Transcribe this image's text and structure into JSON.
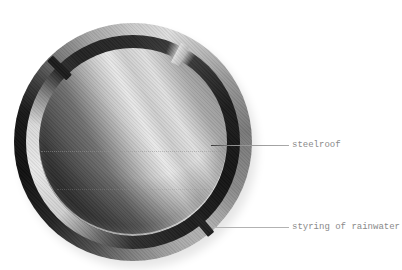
{
  "diagram": {
    "type": "technical-illustration",
    "background_color": "#ffffff",
    "annotations": [
      {
        "id": "steelroof",
        "label": "steelroof"
      },
      {
        "id": "rainwater-steering",
        "label": "styring of rainwater"
      }
    ],
    "palette": {
      "label_text": "#8a8a8a",
      "leader_line": "#b2b2b2",
      "metal_dark": "#141414",
      "metal_mid": "#7a7a7a",
      "metal_light": "#e8e8e8"
    }
  }
}
